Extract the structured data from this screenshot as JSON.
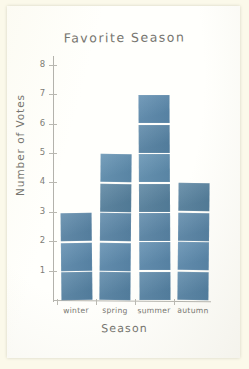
{
  "chart_data": {
    "type": "bar",
    "title": "Favorite Season",
    "xlabel": "Season",
    "ylabel": "Number of Votes",
    "categories": [
      "winter",
      "spring",
      "summer",
      "autumn"
    ],
    "values": [
      3,
      5,
      7,
      4
    ],
    "ylim": [
      0,
      8
    ],
    "yticks": [
      1,
      2,
      3,
      4,
      5,
      6,
      7,
      8
    ],
    "ytick_labels": [
      "1",
      "2",
      "3",
      "4",
      "5",
      "6",
      "7",
      "8"
    ],
    "grid": false,
    "legend": false,
    "bar_color": "#5b87a8",
    "axis_color": "#b6b5ae",
    "text_color": "#76756f",
    "background_color": "#fffffc",
    "style": "hand-drawn paper cut-out squares, one square per vote"
  },
  "axes": {
    "y_title": "Number of Votes",
    "x_title": "Season"
  }
}
